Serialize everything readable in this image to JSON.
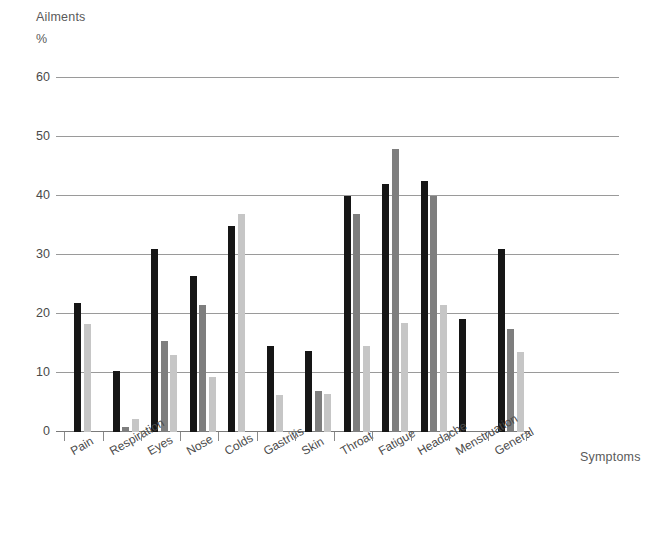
{
  "chart": {
    "type": "bar",
    "title": "Ailments",
    "unit_label": "%",
    "xlabel": "Symptoms",
    "ylabel": "%"
  },
  "chart_data": {
    "type": "bar",
    "title": "Ailments",
    "subtitle": "%",
    "xlabel": "Symptoms",
    "ylabel": "%",
    "ylim": [
      0,
      60
    ],
    "yticks": [
      0,
      10,
      20,
      30,
      40,
      50,
      60
    ],
    "grid": true,
    "legend": "none",
    "orientation": "vertical",
    "grouped": true,
    "categories": [
      "Pain",
      "Respiration",
      "Eyes",
      "Nose",
      "Colds",
      "Gastritis",
      "Skin",
      "Throat",
      "Fatigue",
      "Headache",
      "Menstruation",
      "General"
    ],
    "series": [
      {
        "name": "series-1",
        "color": "#161616",
        "values": [
          21.8,
          10.3,
          31.0,
          26.5,
          35.0,
          14.5,
          13.7,
          40.0,
          42.0,
          42.5,
          19.2,
          31.0
        ]
      },
      {
        "name": "series-2",
        "color": "#7e7e7e",
        "values": [
          null,
          0.8,
          15.5,
          21.5,
          null,
          null,
          7.0,
          37.0,
          48.0,
          40.0,
          null,
          17.5
        ]
      },
      {
        "name": "series-3",
        "color": "#c6c6c6",
        "values": [
          18.3,
          2.2,
          13.0,
          9.3,
          37.0,
          6.3,
          6.5,
          14.5,
          18.5,
          21.5,
          null,
          13.5
        ]
      }
    ]
  }
}
